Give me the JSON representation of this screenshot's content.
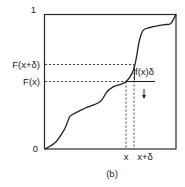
{
  "figure": {
    "caption": "(b)",
    "y_axis": {
      "top_label": "1",
      "bottom_label": "0",
      "tick_labels": [
        "F(x+δ)",
        "F(x)"
      ]
    },
    "x_axis": {
      "tick_labels": [
        "x",
        "x+δ"
      ]
    },
    "annotation": "f(x)δ",
    "arrow_icon": "down-arrow"
  },
  "chart_data": {
    "type": "line",
    "title": "",
    "xlabel": "",
    "ylabel": "",
    "ylim": [
      0,
      1
    ],
    "series": [
      {
        "name": "F(x)",
        "x": [
          0.0,
          0.08,
          0.15,
          0.18,
          0.2,
          0.3,
          0.42,
          0.47,
          0.52,
          0.62,
          0.68,
          0.72,
          0.75,
          0.8,
          0.9,
          0.96,
          1.0
        ],
        "y": [
          0.0,
          0.05,
          0.15,
          0.22,
          0.25,
          0.3,
          0.35,
          0.42,
          0.46,
          0.5,
          0.6,
          0.8,
          0.88,
          0.9,
          0.92,
          0.93,
          1.0
        ]
      }
    ],
    "markers": {
      "x": 0.62,
      "x_plus_delta": 0.68,
      "F_x": 0.5,
      "F_x_plus_delta": 0.63
    }
  }
}
